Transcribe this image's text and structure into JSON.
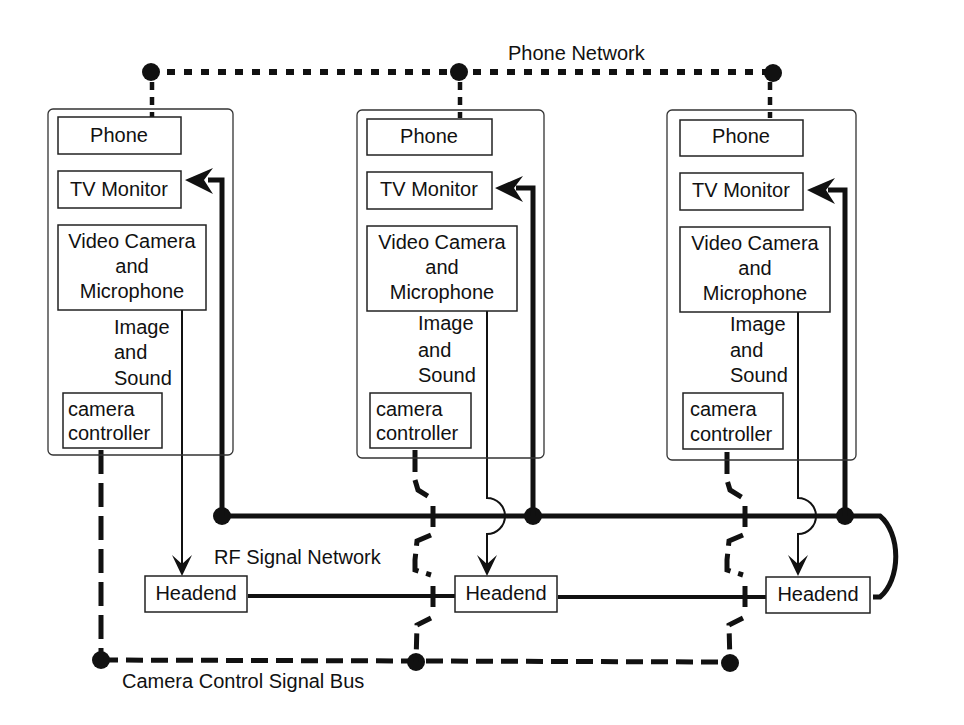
{
  "diagram": {
    "networks": {
      "phone": "Phone Network",
      "rf": "RF Signal Network",
      "camera_bus": "Camera Control Signal Bus"
    },
    "units": [
      {
        "phone": "Phone",
        "tv_monitor": "TV Monitor",
        "camera_line1": "Video Camera",
        "camera_line2": "and",
        "camera_line3": "Microphone",
        "signal_line1": "Image",
        "signal_line2": "and",
        "signal_line3": "Sound",
        "controller_line1": "camera",
        "controller_line2": "controller",
        "headend": "Headend"
      },
      {
        "phone": "Phone",
        "tv_monitor": "TV Monitor",
        "camera_line1": "Video Camera",
        "camera_line2": "and",
        "camera_line3": "Microphone",
        "signal_line1": "Image",
        "signal_line2": "and",
        "signal_line3": "Sound",
        "controller_line1": "camera",
        "controller_line2": "controller",
        "headend": "Headend"
      },
      {
        "phone": "Phone",
        "tv_monitor": "TV Monitor",
        "camera_line1": "Video Camera",
        "camera_line2": "and",
        "camera_line3": "Microphone",
        "signal_line1": "Image",
        "signal_line2": "and",
        "signal_line3": "Sound",
        "controller_line1": "camera",
        "controller_line2": "controller",
        "headend": "Headend"
      }
    ],
    "colors": {
      "line": "#111111",
      "background": "#ffffff"
    }
  }
}
